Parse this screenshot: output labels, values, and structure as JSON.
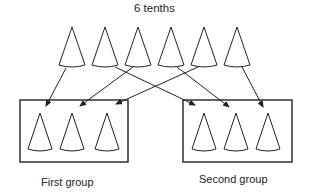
{
  "title": "6 tenths",
  "groups": [
    {
      "label": "First group",
      "box": {
        "x": 20,
        "y": 100,
        "w": 108,
        "h": 62
      },
      "cones": [
        40,
        72,
        107
      ]
    },
    {
      "label": "Second group",
      "box": {
        "x": 183,
        "y": 100,
        "w": 109,
        "h": 62
      },
      "cones": [
        204,
        236,
        268
      ]
    }
  ],
  "top_cones": {
    "tips_x": [
      72,
      105,
      138,
      171,
      204,
      237
    ],
    "tip_y": 27,
    "base_y": 66,
    "half_width": 13
  },
  "group_cone_geom": {
    "tip_y": 113,
    "base_y": 150,
    "half_width": 12
  },
  "arrows": [
    {
      "from_cone": 1,
      "to_group": "First group",
      "x1": 66,
      "y1": 68,
      "x2": 46,
      "y2": 106
    },
    {
      "from_cone": 2,
      "to_group": "Second group",
      "x1": 115,
      "y1": 67,
      "x2": 195,
      "y2": 105
    },
    {
      "from_cone": 3,
      "to_group": "First group",
      "x1": 133,
      "y1": 67,
      "x2": 80,
      "y2": 106
    },
    {
      "from_cone": 4,
      "to_group": "Second group",
      "x1": 177,
      "y1": 67,
      "x2": 229,
      "y2": 107
    },
    {
      "from_cone": 5,
      "to_group": "First group",
      "x1": 198,
      "y1": 67,
      "x2": 116,
      "y2": 104
    },
    {
      "from_cone": 6,
      "to_group": "Second group",
      "x1": 242,
      "y1": 67,
      "x2": 263,
      "y2": 107
    }
  ],
  "stroke_color": "#222222"
}
